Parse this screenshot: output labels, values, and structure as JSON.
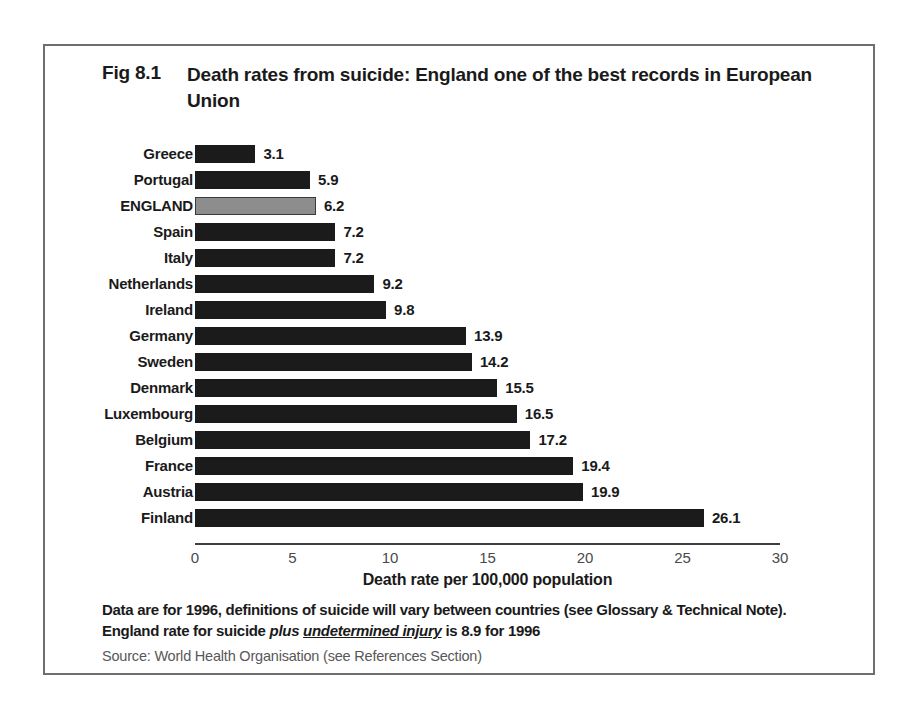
{
  "figure": {
    "number": "Fig 8.1",
    "title": "Death rates from suicide:  England one of the best records in European Union"
  },
  "notes": {
    "line1": "Data are for 1996, definitions of suicide will vary between countries (see Glossary & Technical Note).",
    "line2_a": "England rate for suicide ",
    "line2_em": "plus ",
    "line2_em_underline": "undetermined injury",
    "line2_b": " is 8.9 for 1996",
    "source": "Source: World Health Organisation (see References Section)"
  },
  "colors": {
    "bar": "#1b1b1b",
    "bar_highlight": "#8d8d8d",
    "frame": "#6e6e6e",
    "axis": "#3f3f3f",
    "tick_text": "#4a4a4a",
    "source_text": "#585858"
  },
  "chart_data": {
    "type": "bar",
    "orientation": "horizontal",
    "title": "Death rates from suicide:  England one of the best records in European Union",
    "xlabel": "Death rate per 100,000 population",
    "ylabel": "",
    "xlim": [
      0,
      30
    ],
    "xticks": [
      0,
      5,
      10,
      15,
      20,
      25,
      30
    ],
    "xtick_labels": [
      "0",
      "5",
      "10",
      "15",
      "20",
      "25",
      "30"
    ],
    "grid": false,
    "legend": false,
    "highlight_category": "ENGLAND",
    "categories": [
      "Greece",
      "Portugal",
      "ENGLAND",
      "Spain",
      "Italy",
      "Netherlands",
      "Ireland",
      "Germany",
      "Sweden",
      "Denmark",
      "Luxembourg",
      "Belgium",
      "France",
      "Austria",
      "Finland"
    ],
    "values": [
      3.1,
      5.9,
      6.2,
      7.2,
      7.2,
      9.2,
      9.8,
      13.9,
      14.2,
      15.5,
      16.5,
      17.2,
      19.4,
      19.9,
      26.1
    ],
    "value_labels": [
      "3.1",
      "5.9",
      "6.2",
      "7.2",
      "7.2",
      "9.2",
      "9.8",
      "13.9",
      "14.2",
      "15.5",
      "16.5",
      "17.2",
      "19.4",
      "19.9",
      "26.1"
    ]
  }
}
